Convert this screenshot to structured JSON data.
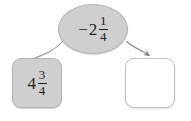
{
  "diagram": {
    "type": "flow-diagram",
    "background_color": "#ffffff",
    "nodes": [
      {
        "id": "start",
        "shape": "ellipse",
        "fill_color": "#cfcfcf",
        "border_color": "#b4b4b4",
        "value": {
          "sign": "−",
          "whole": "2",
          "numerator": "1",
          "denominator": "4",
          "text": "-2 1/4"
        }
      },
      {
        "id": "left-operand",
        "shape": "rounded-square",
        "fill_color": "#cfcfcf",
        "border_color": "#b4b4b4",
        "value": {
          "sign": "",
          "whole": "4",
          "numerator": "3",
          "denominator": "4",
          "text": "4 3/4"
        }
      },
      {
        "id": "answer-blank",
        "shape": "rounded-square",
        "fill_color": "#ffffff",
        "border_color": "#c2c2c2",
        "value": {
          "sign": "",
          "whole": "",
          "numerator": "",
          "denominator": "",
          "text": ""
        }
      }
    ],
    "connectors": [
      {
        "id": "ellipse-to-left",
        "from": "start",
        "to": "left-operand",
        "style": "curved-line",
        "arrowhead": false,
        "color": "#9a9a9a"
      },
      {
        "id": "ellipse-to-answer",
        "from": "start",
        "to": "answer-blank",
        "style": "curved-arrow",
        "arrowhead": true,
        "color": "#808080"
      }
    ]
  }
}
